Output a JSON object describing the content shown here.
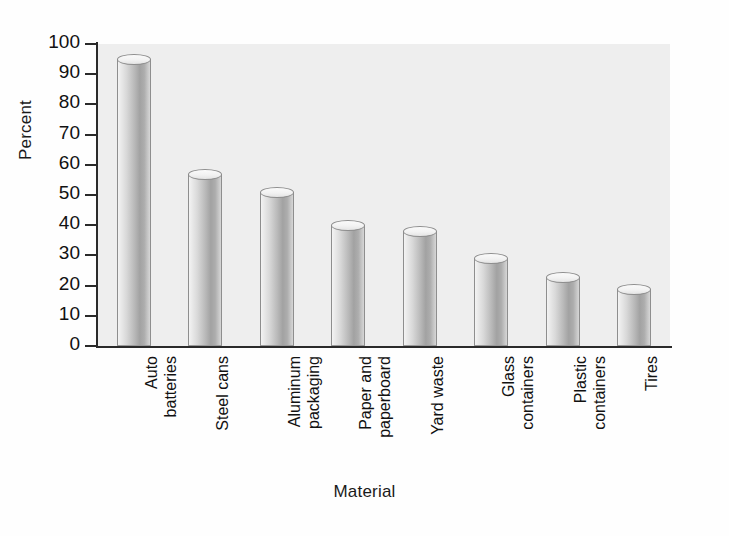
{
  "chart_data": {
    "type": "bar",
    "title": "",
    "xlabel": "Material",
    "ylabel": "Percent",
    "categories": [
      "Auto batteries",
      "Steel cans",
      "Aluminum packaging",
      "Paper and paperboard",
      "Yard waste",
      "Glass containers",
      "Plastic containers",
      "Tires"
    ],
    "category_lines": [
      [
        "Auto",
        "batteries"
      ],
      [
        "Steel cans"
      ],
      [
        "Aluminum",
        "packaging"
      ],
      [
        "Paper and",
        "paperboard"
      ],
      [
        "Yard waste"
      ],
      [
        "Glass",
        "containers"
      ],
      [
        "Plastic",
        "containers"
      ],
      [
        "Tires"
      ]
    ],
    "values": [
      95,
      57,
      51,
      40,
      38,
      29,
      23,
      19
    ],
    "ylim": [
      0,
      100
    ],
    "ytick_labels": [
      "100",
      "90",
      "80",
      "70",
      "60",
      "50",
      "40",
      "30",
      "20",
      "10",
      "0"
    ],
    "ytick_values": [
      100,
      90,
      80,
      70,
      60,
      50,
      40,
      30,
      20,
      10,
      0
    ],
    "grid": false,
    "legend": false,
    "bar_style": "cylinder",
    "colors": {
      "plot_background": "#eeeeee",
      "page_background": "#fefefe",
      "axis": "#2a2a2a",
      "bar_light": "#f3f3f3",
      "bar_dark": "#a2a2a2",
      "text": "#111111"
    }
  }
}
